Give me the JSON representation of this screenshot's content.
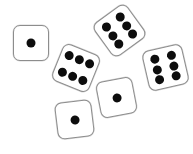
{
  "scene": {
    "title": "Six scattered dice",
    "description": "Photo-style illustration of six white dice with black pips scattered on a white background",
    "width": 193,
    "height": 154,
    "background_color": "#ffffff",
    "die_face_color": "#ffffff",
    "die_border_color": "#8d8d8d",
    "pip_color": "#0d0d0d",
    "die_count": 6,
    "pip_total": 21
  },
  "dice": [
    {
      "id": "die-1-top-left",
      "value": 1,
      "value_label": "1",
      "x": 13,
      "y": 25,
      "size": 36,
      "rotation": 0,
      "pip_size": 9,
      "pip_layout": [
        [
          50,
          50
        ]
      ]
    },
    {
      "id": "die-2-top-center",
      "value": 6,
      "value_label": "6",
      "x": 99,
      "y": 10,
      "size": 41,
      "rotation": -36,
      "pip_size": 9,
      "pip_layout": [
        [
          27,
          22
        ],
        [
          27,
          50
        ],
        [
          27,
          78
        ],
        [
          73,
          22
        ],
        [
          73,
          50
        ],
        [
          73,
          78
        ]
      ]
    },
    {
      "id": "die-3-middle-left",
      "value": 6,
      "value_label": "6",
      "x": 56,
      "y": 48,
      "size": 40,
      "rotation": 22,
      "pip_size": 9,
      "pip_layout": [
        [
          22,
          27
        ],
        [
          50,
          27
        ],
        [
          78,
          27
        ],
        [
          22,
          73
        ],
        [
          50,
          73
        ],
        [
          78,
          73
        ]
      ]
    },
    {
      "id": "die-4-right",
      "value": 6,
      "value_label": "6",
      "x": 145,
      "y": 47,
      "size": 41,
      "rotation": -13,
      "pip_size": 9,
      "pip_layout": [
        [
          27,
          22
        ],
        [
          27,
          50
        ],
        [
          27,
          78
        ],
        [
          73,
          22
        ],
        [
          73,
          50
        ],
        [
          73,
          78
        ]
      ]
    },
    {
      "id": "die-5-bottom-center",
      "value": 1,
      "value_label": "1",
      "x": 98,
      "y": 79,
      "size": 37,
      "rotation": -11,
      "pip_size": 9,
      "pip_layout": [
        [
          50,
          50
        ]
      ]
    },
    {
      "id": "die-6-bottom-left",
      "value": 1,
      "value_label": "1",
      "x": 56,
      "y": 101,
      "size": 37,
      "rotation": -7,
      "pip_size": 9,
      "pip_layout": [
        [
          50,
          50
        ]
      ]
    }
  ]
}
